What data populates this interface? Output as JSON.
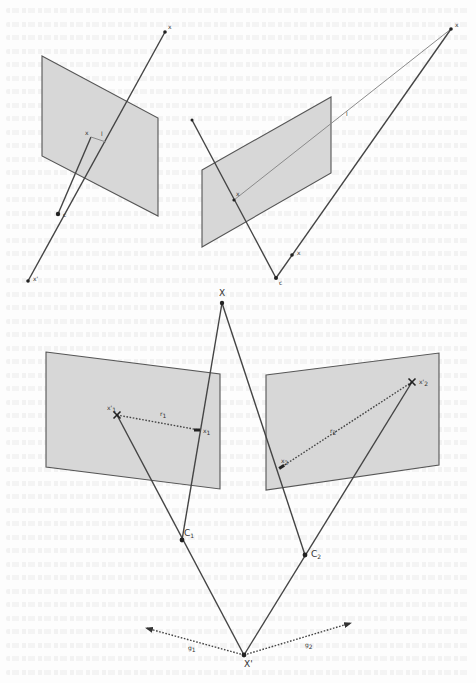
{
  "figure": {
    "panel_top_left": {
      "plane": [
        [
          42,
          56
        ],
        [
          158,
          118
        ],
        [
          158,
          216
        ],
        [
          42,
          156
        ]
      ],
      "points": {
        "X": {
          "pos": [
            165,
            32
          ],
          "label": "x",
          "label_offset": [
            3,
            -3
          ]
        },
        "x": {
          "pos": [
            91,
            137
          ],
          "label": "x",
          "label_offset": [
            -6,
            -2
          ]
        },
        "l": {
          "pos": [
            100,
            139
          ],
          "label": "l",
          "label_offset": [
            1,
            -3
          ]
        },
        "C": {
          "pos": [
            58,
            214
          ],
          "label": "c",
          "label_offset": [
            5,
            3
          ]
        },
        "Xp": {
          "pos": [
            28,
            281
          ],
          "label": "x'",
          "label_offset": [
            5,
            0
          ]
        }
      }
    },
    "panel_top_right": {
      "plane": [
        [
          202,
          170
        ],
        [
          331,
          97
        ],
        [
          331,
          173
        ],
        [
          202,
          247
        ]
      ],
      "points": {
        "X": {
          "pos": [
            451,
            29
          ],
          "label": "x",
          "label_offset": [
            4,
            -2
          ]
        },
        "x_on_plane": {
          "pos": [
            234,
            200
          ],
          "label": "x",
          "label_offset": [
            2,
            -4
          ]
        },
        "l": {
          "pos": [
            346,
            116
          ],
          "label": "l",
          "label_offset": [
            0,
            0
          ]
        },
        "x_lower": {
          "pos": [
            292,
            255
          ],
          "label": "x",
          "label_offset": [
            5,
            0
          ]
        },
        "C": {
          "pos": [
            276,
            278
          ],
          "label": "c",
          "label_offset": [
            3,
            7
          ]
        },
        "line_start": {
          "pos": [
            192,
            120
          ]
        }
      }
    },
    "panel_bottom": {
      "plane_left": [
        [
          46,
          352
        ],
        [
          220,
          374
        ],
        [
          220,
          489
        ],
        [
          46,
          467
        ]
      ],
      "plane_right": [
        [
          266,
          375
        ],
        [
          439,
          353
        ],
        [
          439,
          465
        ],
        [
          266,
          490
        ]
      ],
      "points": {
        "X": {
          "pos": [
            222,
            303
          ],
          "label": "X"
        },
        "x1p": {
          "pos": [
            117,
            415
          ],
          "label": "x'",
          "sub": "1"
        },
        "x1": {
          "pos": [
            199,
            430
          ],
          "label": "x",
          "sub": "1"
        },
        "r1": {
          "pos": [
            160,
            418
          ],
          "label": "r",
          "sub": "1"
        },
        "x2p": {
          "pos": [
            412,
            382
          ],
          "label": "x'",
          "sub": "2"
        },
        "x2": {
          "pos": [
            280,
            468
          ],
          "label": "x",
          "sub": "2"
        },
        "r2": {
          "pos": [
            330,
            433
          ],
          "label": "r",
          "sub": "2"
        },
        "C1": {
          "pos": [
            182,
            540
          ],
          "label": "C",
          "sub": "1"
        },
        "C2": {
          "pos": [
            305,
            555
          ],
          "label": "C",
          "sub": "2"
        },
        "Xpp": {
          "pos": [
            244,
            655
          ],
          "label": "X'"
        },
        "g1_tip": {
          "pos": [
            146,
            628
          ]
        },
        "g2_tip": {
          "pos": [
            351,
            623
          ]
        },
        "g1": {
          "pos": [
            188,
            650
          ],
          "label": "g",
          "sub": "1"
        },
        "g2": {
          "pos": [
            305,
            647
          ],
          "label": "g",
          "sub": "2"
        }
      }
    }
  }
}
